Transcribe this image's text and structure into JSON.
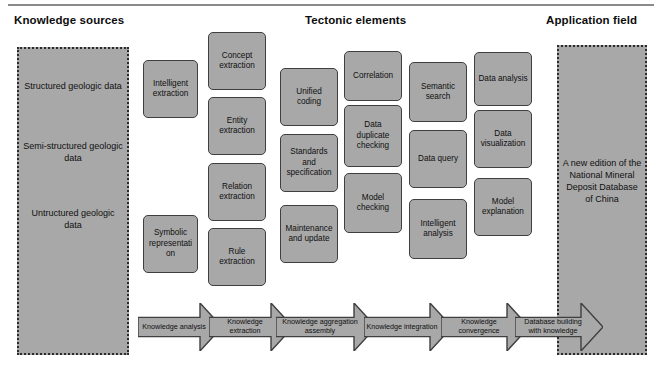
{
  "headings": [
    {
      "label": "Knowledge sources",
      "x": 14,
      "y": 14
    },
    {
      "label": "Tectonic elements",
      "x": 305,
      "y": 14
    },
    {
      "label": "Application field",
      "x": 546,
      "y": 14
    }
  ],
  "panels": {
    "left": {
      "name": "knowledge-sources-panel",
      "x": 17,
      "y": 47,
      "w": 112,
      "h": 308,
      "items": [
        {
          "label": "Structured geologic data",
          "y": 78
        },
        {
          "label": "Semi-structured geologic data",
          "y": 138
        },
        {
          "label": "Untructured geologic data",
          "y": 205
        }
      ]
    },
    "right": {
      "name": "application-field-panel",
      "x": 557,
      "y": 45,
      "w": 90,
      "h": 310,
      "items": [
        {
          "label": "A new edition of the National Mineral Deposit Database of China",
          "y": 155
        }
      ]
    }
  },
  "boxes": [
    {
      "name": "intelligent-extraction",
      "label": "Intelligent extraction",
      "x": 143,
      "y": 60,
      "w": 55,
      "h": 58
    },
    {
      "name": "symbolic-representation",
      "label": "Symbolic representation",
      "x": 143,
      "y": 215,
      "w": 55,
      "h": 58
    },
    {
      "name": "concept-extraction",
      "label": "Concept extraction",
      "x": 208,
      "y": 32,
      "w": 58,
      "h": 58
    },
    {
      "name": "entity-extraction",
      "label": "Entity extraction",
      "x": 208,
      "y": 97,
      "w": 58,
      "h": 58
    },
    {
      "name": "relation-extraction",
      "label": "Relation extraction",
      "x": 208,
      "y": 163,
      "w": 58,
      "h": 58
    },
    {
      "name": "rule-extraction",
      "label": "Rule extraction",
      "x": 208,
      "y": 228,
      "w": 58,
      "h": 58
    },
    {
      "name": "unified-coding",
      "label": "Unified coding",
      "x": 280,
      "y": 68,
      "w": 58,
      "h": 58
    },
    {
      "name": "standards-and-specification",
      "label": "Standards and specification",
      "x": 280,
      "y": 134,
      "w": 58,
      "h": 58
    },
    {
      "name": "maintenance-and-update",
      "label": "Maintenance and update",
      "x": 280,
      "y": 205,
      "w": 58,
      "h": 58
    },
    {
      "name": "correlation",
      "label": "Correlation",
      "x": 344,
      "y": 51,
      "w": 58,
      "h": 50
    },
    {
      "name": "data-duplicate-checking",
      "label": "Data duplicate checking",
      "x": 344,
      "y": 105,
      "w": 58,
      "h": 62
    },
    {
      "name": "model-checking",
      "label": "Model checking",
      "x": 344,
      "y": 173,
      "w": 58,
      "h": 60
    },
    {
      "name": "semantic-search",
      "label": "Semantic search",
      "x": 409,
      "y": 62,
      "w": 58,
      "h": 60
    },
    {
      "name": "data-query",
      "label": "Data query",
      "x": 409,
      "y": 130,
      "w": 58,
      "h": 58
    },
    {
      "name": "intelligent-analysis",
      "label": "Intelligent analysis",
      "x": 409,
      "y": 199,
      "w": 58,
      "h": 60
    },
    {
      "name": "data-analysis",
      "label": "Data analysis",
      "x": 474,
      "y": 52,
      "w": 58,
      "h": 54
    },
    {
      "name": "data-visualization",
      "label": "Data visualization",
      "x": 474,
      "y": 110,
      "w": 58,
      "h": 58
    },
    {
      "name": "model-explanation",
      "label": "Model explanation",
      "x": 474,
      "y": 178,
      "w": 58,
      "h": 58
    }
  ],
  "arrows": [
    {
      "name": "arrow-knowledge-analysis",
      "label": "Knowledge analysis",
      "x": 138,
      "y": 303,
      "w": 84,
      "h": 48
    },
    {
      "name": "arrow-knowledge-extraction",
      "label": "Knowledge extraction",
      "x": 209,
      "y": 303,
      "w": 84,
      "h": 48
    },
    {
      "name": "arrow-knowledge-aggregation-assembly",
      "label": "Knowledge aggregation assembly",
      "x": 276,
      "y": 303,
      "w": 100,
      "h": 48
    },
    {
      "name": "arrow-knowledge-integration",
      "label": "Knowledge integration",
      "x": 364,
      "y": 303,
      "w": 88,
      "h": 48
    },
    {
      "name": "arrow-knowledge-convergence",
      "label": "Knowledge convergence",
      "x": 441,
      "y": 303,
      "w": 88,
      "h": 48
    },
    {
      "name": "arrow-database-building-with-knowledge",
      "label": "Database building with knowledge",
      "x": 515,
      "y": 303,
      "w": 88,
      "h": 48
    }
  ],
  "colors": {
    "box_fill": "#a8a8a8",
    "box_border": "#3f3f3f",
    "panel_border": "#2b2b2b",
    "text": "#0f0f0f",
    "rule": "#8a8a8a",
    "background": "#ffffff"
  }
}
